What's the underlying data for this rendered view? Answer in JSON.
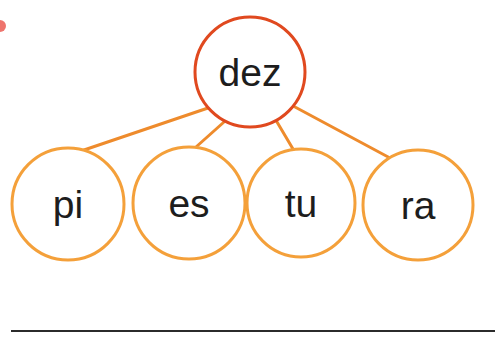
{
  "page": {
    "width": 495,
    "height": 358,
    "background": "#ffffff",
    "kind": "syllable-word-tree-worksheet"
  },
  "colors": {
    "root_stroke": "#E0491F",
    "leaf_stroke": "#F4A03A",
    "edge_stroke": "#EE8B2C",
    "text": "#1d1d1d",
    "rule": "#2b2b2b",
    "corner_mark": "#E8453C"
  },
  "diagram": {
    "type": "word-syllable-tree",
    "root": {
      "id": "root-dez",
      "label": "dez",
      "cx": 250,
      "cy": 72,
      "r": 55,
      "stroke": "#E0491F",
      "stroke_width": 3
    },
    "leaves": [
      {
        "id": "leaf-pi",
        "label": "pi",
        "cx": 68,
        "cy": 204,
        "r": 56,
        "stroke": "#F4A03A",
        "stroke_width": 3
      },
      {
        "id": "leaf-es",
        "label": "es",
        "cx": 189,
        "cy": 203,
        "r": 56,
        "stroke": "#F4A03A",
        "stroke_width": 3
      },
      {
        "id": "leaf-tu",
        "label": "tu",
        "cx": 301,
        "cy": 203,
        "r": 54,
        "stroke": "#F4A03A",
        "stroke_width": 3
      },
      {
        "id": "leaf-ra",
        "label": "ra",
        "cx": 418,
        "cy": 205,
        "r": 55,
        "stroke": "#F4A03A",
        "stroke_width": 3
      }
    ],
    "edges": [
      {
        "id": "edge-dez-pi",
        "from": "root-dez",
        "to": "leaf-pi",
        "x1": 208,
        "y1": 108,
        "x2": 84,
        "y2": 150
      },
      {
        "id": "edge-dez-es",
        "from": "root-dez",
        "to": "leaf-es",
        "x1": 224,
        "y1": 122,
        "x2": 196,
        "y2": 147
      },
      {
        "id": "edge-dez-tu",
        "from": "root-dez",
        "to": "leaf-tu",
        "x1": 277,
        "y1": 122,
        "x2": 293,
        "y2": 149
      },
      {
        "id": "edge-dez-ra",
        "from": "root-dez",
        "to": "leaf-ra",
        "x1": 295,
        "y1": 107,
        "x2": 390,
        "y2": 158
      }
    ],
    "rule": {
      "id": "answer-rule",
      "x1": 11,
      "y1": 331,
      "x2": 495,
      "y2": 331,
      "stroke": "#2b2b2b",
      "stroke_width": 2
    },
    "corner_mark": {
      "id": "corner-mark",
      "cx": 0,
      "cy": 26,
      "r": 6,
      "fill": "#E8453C"
    }
  },
  "labels": {
    "root": "dez",
    "leaf_pi": "pi",
    "leaf_es": "es",
    "leaf_tu": "tu",
    "leaf_ra": "ra"
  }
}
